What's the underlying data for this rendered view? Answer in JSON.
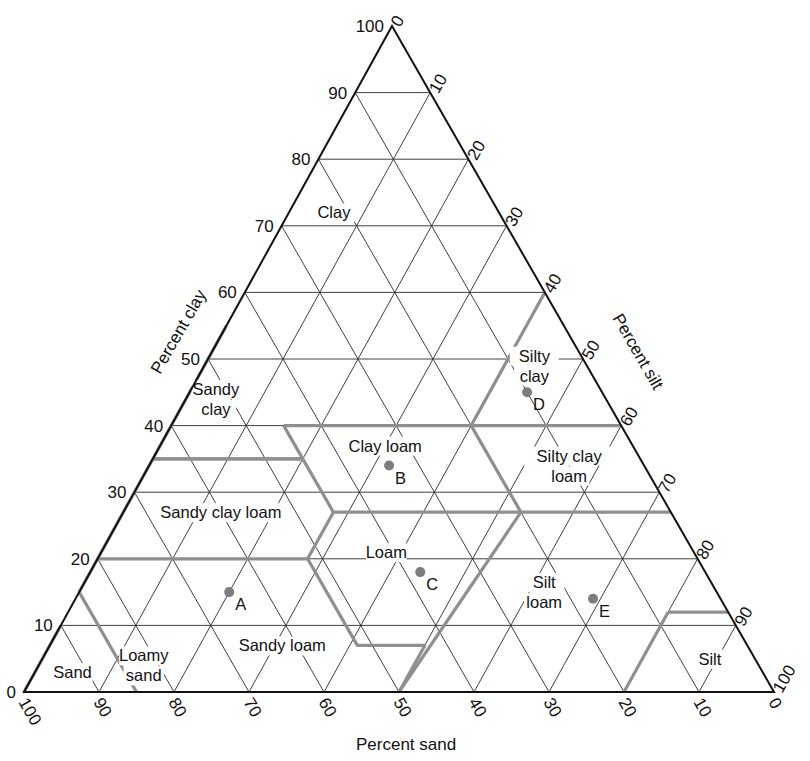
{
  "axes": {
    "clay": {
      "label": "Percent clay",
      "ticks": [
        "0",
        "10",
        "20",
        "30",
        "40",
        "50",
        "60",
        "70",
        "80",
        "90",
        "100"
      ]
    },
    "silt": {
      "label": "Percent silt",
      "ticks": [
        "0",
        "10",
        "20",
        "30",
        "40",
        "50",
        "60",
        "70",
        "80",
        "90",
        "100"
      ]
    },
    "sand": {
      "label": "Percent sand",
      "ticks": [
        "100",
        "90",
        "80",
        "70",
        "60",
        "50",
        "40",
        "30",
        "20",
        "10",
        "0"
      ]
    }
  },
  "regions": [
    {
      "name": "clay",
      "lines": [
        "Clay"
      ],
      "clay": 72,
      "sand": 22
    },
    {
      "name": "silty-clay",
      "lines": [
        "Silty",
        "clay"
      ],
      "clay": 49,
      "sand": 7
    },
    {
      "name": "sandy-clay",
      "lines": [
        "Sandy",
        "clay"
      ],
      "clay": 44,
      "sand": 52
    },
    {
      "name": "clay-loam",
      "lines": [
        "Clay loam"
      ],
      "clay": 37,
      "sand": 33
    },
    {
      "name": "silty-clay-loam",
      "lines": [
        "Silty clay",
        "loam"
      ],
      "clay": 34,
      "sand": 10
    },
    {
      "name": "sandy-clay-loam",
      "lines": [
        "Sandy clay loam"
      ],
      "clay": 27,
      "sand": 60
    },
    {
      "name": "loam",
      "lines": [
        "Loam"
      ],
      "clay": 21,
      "sand": 41
    },
    {
      "name": "silt-loam",
      "lines": [
        "Silt",
        "loam"
      ],
      "clay": 15,
      "sand": 23
    },
    {
      "name": "sandy-loam",
      "lines": [
        "Sandy loam"
      ],
      "clay": 7,
      "sand": 62
    },
    {
      "name": "loamy-sand",
      "lines": [
        "Loamy",
        "sand"
      ],
      "clay": 4,
      "sand": 82
    },
    {
      "name": "sand",
      "lines": [
        "Sand"
      ],
      "clay": 3,
      "sand": 92
    },
    {
      "name": "silt",
      "lines": [
        "Silt"
      ],
      "clay": 5,
      "sand": 6
    }
  ],
  "points": [
    {
      "label": "A",
      "clay": 15,
      "sand": 65
    },
    {
      "label": "B",
      "clay": 34,
      "sand": 34
    },
    {
      "label": "C",
      "clay": 18,
      "sand": 38
    },
    {
      "label": "D",
      "clay": 45,
      "sand": 10
    },
    {
      "label": "E",
      "clay": 14,
      "sand": 17
    }
  ],
  "boundaries": [
    [
      [
        40,
        45
      ],
      [
        40,
        20
      ],
      [
        60,
        0
      ]
    ],
    [
      [
        40,
        20
      ],
      [
        40,
        0
      ]
    ],
    [
      [
        55,
        45
      ],
      [
        35,
        65
      ],
      [
        35,
        45
      ]
    ],
    [
      [
        40,
        45
      ],
      [
        27,
        45
      ],
      [
        27,
        20
      ],
      [
        40,
        20
      ]
    ],
    [
      [
        27,
        45
      ],
      [
        20,
        52
      ],
      [
        7,
        52
      ],
      [
        7,
        43
      ],
      [
        0,
        50
      ]
    ],
    [
      [
        20,
        52
      ],
      [
        20,
        80
      ],
      [
        15,
        85
      ],
      [
        0,
        85
      ]
    ],
    [
      [
        10,
        90
      ],
      [
        0,
        100
      ]
    ],
    [
      [
        27,
        20
      ],
      [
        27,
        0
      ]
    ],
    [
      [
        27,
        20
      ],
      [
        0,
        50
      ]
    ],
    [
      [
        12,
        8
      ],
      [
        0,
        20
      ]
    ],
    [
      [
        12,
        8
      ],
      [
        12,
        0
      ]
    ],
    [
      [
        35,
        65
      ],
      [
        28,
        72
      ]
    ],
    [
      [
        28,
        72
      ],
      [
        20,
        80
      ]
    ],
    [
      [
        35,
        65
      ],
      [
        35,
        45
      ]
    ]
  ],
  "colors": {
    "frame": "#111111",
    "grid": "#2a2a2a",
    "boundary": "#8f8f8f",
    "point": "#7d7d7d"
  }
}
